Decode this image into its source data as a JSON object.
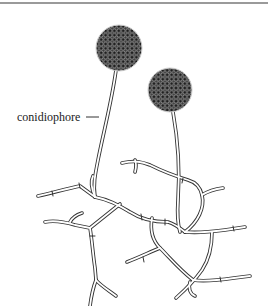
{
  "figure": {
    "labels": [
      {
        "text": "conidiophore",
        "points_to": "left conidiophore stalk"
      }
    ],
    "colors": {
      "ink": "#222222",
      "spore_fill": "#2a2a2a",
      "spore_outline": "#bdbdbd",
      "background": "#ffffff",
      "top_rule": "#9a9a9a"
    },
    "spore_heads": [
      {
        "cx": 119,
        "cy": 48,
        "r": 23
      },
      {
        "cx": 170,
        "cy": 90,
        "r": 22
      }
    ]
  }
}
